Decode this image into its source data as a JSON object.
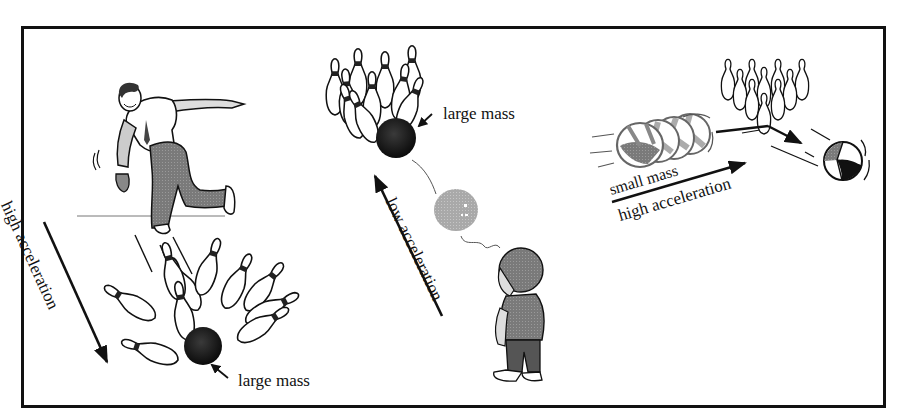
{
  "figure": {
    "topic": "Newton's second law: mass vs. acceleration",
    "panels": [
      {
        "id": "bowler",
        "labels": {
          "arrow_label": "high acceleration",
          "mass_label": "large mass"
        },
        "subjects": [
          "adult bowler",
          "bowling ball",
          "bowling pins"
        ]
      },
      {
        "id": "child",
        "labels": {
          "arrow_label": "low acceleration",
          "mass_label": "large mass"
        },
        "subjects": [
          "child",
          "bowling ball",
          "bowling pins",
          "thought bubble"
        ]
      },
      {
        "id": "beach-ball",
        "labels": {
          "mass_label": "small mass",
          "arrow_label": "high acceleration"
        },
        "subjects": [
          "beach ball",
          "bowling pins"
        ]
      }
    ],
    "colors": {
      "ink": "#111111",
      "gray_fill": "#8a8a8a",
      "light_gray": "#b5b5b5",
      "background": "#ffffff"
    }
  }
}
